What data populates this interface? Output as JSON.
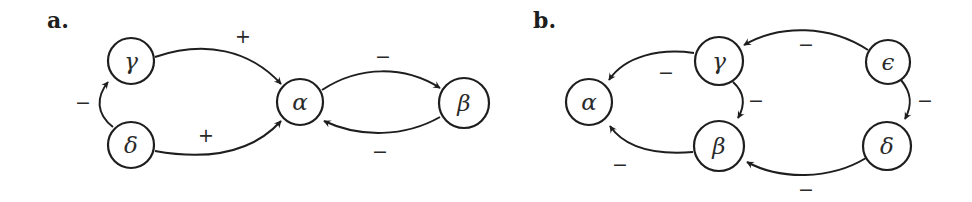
{
  "figure": {
    "panels": [
      {
        "label": "a.",
        "nodes": [
          {
            "id": "gamma",
            "symbol": "γ"
          },
          {
            "id": "delta",
            "symbol": "δ"
          },
          {
            "id": "alpha",
            "symbol": "α"
          },
          {
            "id": "beta",
            "symbol": "β"
          }
        ],
        "edges": [
          {
            "from": "gamma",
            "to": "alpha",
            "sign": "+"
          },
          {
            "from": "delta",
            "to": "alpha",
            "sign": "+"
          },
          {
            "from": "delta",
            "to": "gamma",
            "sign": "−"
          },
          {
            "from": "alpha",
            "to": "beta",
            "sign": "−"
          },
          {
            "from": "beta",
            "to": "alpha",
            "sign": "−"
          }
        ]
      },
      {
        "label": "b.",
        "nodes": [
          {
            "id": "alpha",
            "symbol": "α"
          },
          {
            "id": "gamma",
            "symbol": "γ"
          },
          {
            "id": "beta",
            "symbol": "β"
          },
          {
            "id": "epsilon",
            "symbol": "ϵ"
          },
          {
            "id": "delta",
            "symbol": "δ"
          }
        ],
        "edges": [
          {
            "from": "gamma",
            "to": "alpha",
            "sign": "−"
          },
          {
            "from": "beta",
            "to": "alpha",
            "sign": "−"
          },
          {
            "from": "gamma",
            "to": "beta",
            "sign": "−"
          },
          {
            "from": "epsilon",
            "to": "gamma",
            "sign": "−"
          },
          {
            "from": "epsilon",
            "to": "delta",
            "sign": "−"
          },
          {
            "from": "delta",
            "to": "beta",
            "sign": "−"
          }
        ]
      }
    ]
  }
}
